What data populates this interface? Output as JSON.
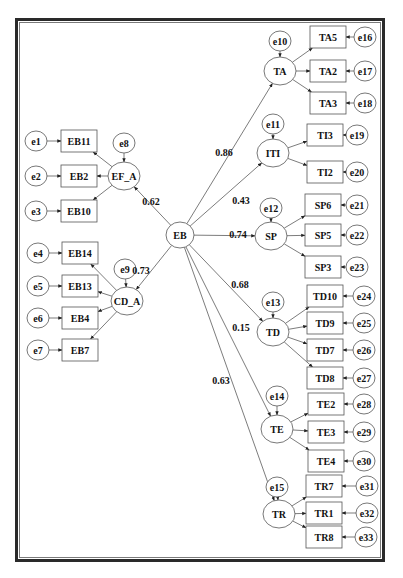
{
  "diagram": {
    "type": "structural-equation-model",
    "root": {
      "id": "EB",
      "label": "EB",
      "x": 180,
      "y": 235
    },
    "latents": [
      {
        "id": "EF_A",
        "label": "EF_A",
        "x": 124,
        "y": 176,
        "error": {
          "label": "e8",
          "x": 124,
          "y": 143
        },
        "coef": "0.62",
        "coef_x": 151,
        "coef_y": 201,
        "indicators": [
          {
            "label": "EB11",
            "x": 79,
            "y": 141,
            "error": "e1",
            "ex": 36
          },
          {
            "label": "EB2",
            "x": 79,
            "y": 176,
            "error": "e2",
            "ex": 36
          },
          {
            "label": "EB10",
            "x": 79,
            "y": 211,
            "error": "e3",
            "ex": 36
          }
        ]
      },
      {
        "id": "CD_A",
        "label": "CD_A",
        "x": 127,
        "y": 301,
        "error": {
          "label": "e9",
          "x": 125,
          "y": 269
        },
        "coef": "0.73",
        "coef_x": 141,
        "coef_y": 270,
        "indicators": [
          {
            "label": "EB14",
            "x": 80,
            "y": 253,
            "error": "e4",
            "ex": 38
          },
          {
            "label": "EB13",
            "x": 80,
            "y": 286,
            "error": "e5",
            "ex": 38
          },
          {
            "label": "EB4",
            "x": 80,
            "y": 318,
            "error": "e6",
            "ex": 38
          },
          {
            "label": "EB7",
            "x": 80,
            "y": 350,
            "error": "e7",
            "ex": 38
          }
        ]
      },
      {
        "id": "TA",
        "label": "TA",
        "x": 280,
        "y": 71,
        "error": {
          "label": "e10",
          "x": 280,
          "y": 41
        },
        "coef": "0.86",
        "coef_x": 224,
        "coef_y": 152,
        "indicators": [
          {
            "label": "TA5",
            "x": 328,
            "y": 37,
            "error": "e16",
            "ex": 365
          },
          {
            "label": "TA2",
            "x": 328,
            "y": 71,
            "error": "e17",
            "ex": 365
          },
          {
            "label": "TA3",
            "x": 328,
            "y": 103,
            "error": "e18",
            "ex": 365
          }
        ]
      },
      {
        "id": "ITI",
        "label": "ITI",
        "x": 273,
        "y": 153,
        "error": {
          "label": "e11",
          "x": 273,
          "y": 124
        },
        "coef": "0.43",
        "coef_x": 241,
        "coef_y": 200,
        "indicators": [
          {
            "label": "TI3",
            "x": 325,
            "y": 135,
            "error": "e19",
            "ex": 357
          },
          {
            "label": "TI2",
            "x": 325,
            "y": 172,
            "error": "e20",
            "ex": 357
          }
        ]
      },
      {
        "id": "SP",
        "label": "SP",
        "x": 271,
        "y": 236,
        "error": {
          "label": "e12",
          "x": 271,
          "y": 208
        },
        "coef": "0.74",
        "coef_x": 238,
        "coef_y": 234,
        "indicators": [
          {
            "label": "SP6",
            "x": 323,
            "y": 205,
            "error": "e21",
            "ex": 357
          },
          {
            "label": "SP5",
            "x": 323,
            "y": 235,
            "error": "e22",
            "ex": 357
          },
          {
            "label": "SP3",
            "x": 323,
            "y": 267,
            "error": "e23",
            "ex": 357
          }
        ]
      },
      {
        "id": "TD",
        "label": "TD",
        "x": 273,
        "y": 332,
        "error": {
          "label": "e13",
          "x": 273,
          "y": 302
        },
        "coef": "0.68",
        "coef_x": 240,
        "coef_y": 284,
        "indicators": [
          {
            "label": "TD10",
            "x": 325,
            "y": 296,
            "error": "e24",
            "ex": 364
          },
          {
            "label": "TD9",
            "x": 325,
            "y": 323,
            "error": "e25",
            "ex": 364
          },
          {
            "label": "TD7",
            "x": 325,
            "y": 350,
            "error": "e26",
            "ex": 364
          },
          {
            "label": "TD8",
            "x": 325,
            "y": 378,
            "error": "e27",
            "ex": 364
          }
        ]
      },
      {
        "id": "TE",
        "label": "TE",
        "x": 277,
        "y": 429,
        "error": {
          "label": "e14",
          "x": 277,
          "y": 396
        },
        "coef": "0.15",
        "coef_x": 241,
        "coef_y": 327,
        "indicators": [
          {
            "label": "TE2",
            "x": 326,
            "y": 404,
            "error": "e28",
            "ex": 364
          },
          {
            "label": "TE3",
            "x": 326,
            "y": 432,
            "error": "e29",
            "ex": 364
          },
          {
            "label": "TE4",
            "x": 326,
            "y": 461,
            "error": "e30",
            "ex": 364
          }
        ]
      },
      {
        "id": "TR",
        "label": "TR",
        "x": 279,
        "y": 514,
        "error": {
          "label": "e15",
          "x": 277,
          "y": 487
        },
        "coef": "0.63",
        "coef_x": 221,
        "coef_y": 380,
        "indicators": [
          {
            "label": "TR7",
            "x": 324,
            "y": 486,
            "error": "e31",
            "ex": 367
          },
          {
            "label": "TR1",
            "x": 324,
            "y": 513,
            "error": "e32",
            "ex": 367
          },
          {
            "label": "TR8",
            "x": 324,
            "y": 537,
            "error": "e33",
            "ex": 366
          }
        ]
      }
    ]
  }
}
